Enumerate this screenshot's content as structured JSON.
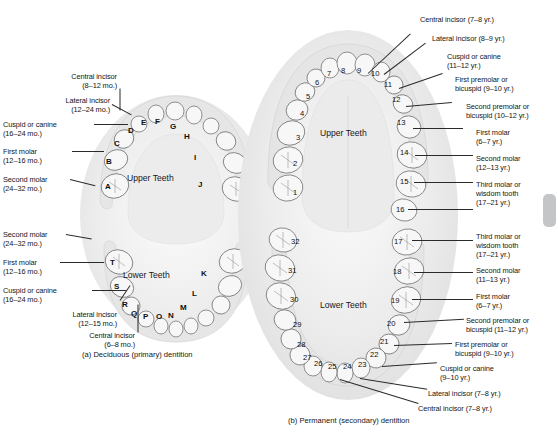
{
  "figure": {
    "panel_a": {
      "caption": "(a) Deciduous (primary) dentition",
      "upper_arch_name": "Upper Teeth",
      "lower_arch_name": "Lower Teeth",
      "upper_labels": [
        {
          "name": "Central incisor",
          "age": "(8–12 mo.)"
        },
        {
          "name": "Lateral incisor",
          "age": "(12–24 mo.)"
        },
        {
          "name": "Cuspid or canine",
          "age": "(16–24 mo.)"
        },
        {
          "name": "First molar",
          "age": "(12–16 mo.)"
        },
        {
          "name": "Second molar",
          "age": "(24–32 mo.)"
        }
      ],
      "lower_labels": [
        {
          "name": "Second molar",
          "age": "(24–32 mo.)"
        },
        {
          "name": "First molar",
          "age": "(12–16 mo.)"
        },
        {
          "name": "Cuspid or canine",
          "age": "(16–24 mo.)"
        },
        {
          "name": "Lateral incisor",
          "age": "(12–15 mo.)"
        },
        {
          "name": "Central incisor",
          "age": "(6–8 mo.)"
        }
      ],
      "upper_tooth_codes": [
        "A",
        "B",
        "C",
        "D",
        "E",
        "F",
        "G",
        "H",
        "I",
        "J"
      ],
      "lower_tooth_codes": [
        "K",
        "L",
        "M",
        "N",
        "O",
        "P",
        "Q",
        "R",
        "S",
        "T"
      ]
    },
    "panel_b": {
      "caption": "(b) Permanent (secondary) dentition",
      "upper_arch_name": "Upper Teeth",
      "lower_arch_name": "Lower Teeth",
      "upper_labels": [
        {
          "name": "Central incisor (7–8 yr.)"
        },
        {
          "name": "Lateral incisor (8–9 yr.)"
        },
        {
          "name": "Cuspid or canine",
          "age": "(11–12 yr.)"
        },
        {
          "name": "First premolar or",
          "age": "bicuspid (9–10 yr.)"
        },
        {
          "name": "Second premolar or",
          "age": "bicuspid (10–12 yr.)"
        },
        {
          "name": "First molar",
          "age": "(6–7 yr.)"
        },
        {
          "name": "Second molar",
          "age": "(12–13 yr.)"
        },
        {
          "name": "Third molar or",
          "age": "wisdom tooth",
          "age2": "(17–21 yr.)"
        }
      ],
      "lower_labels": [
        {
          "name": "Third molar or",
          "age": "wisdom tooth",
          "age2": "(17–21 yr.)"
        },
        {
          "name": "Second molar",
          "age": "(11–13 yr.)"
        },
        {
          "name": "First molar",
          "age": "(6–7 yr.)"
        },
        {
          "name": "Second premolar or",
          "age": "bicuspid (11–12 yr.)"
        },
        {
          "name": "First premolar or",
          "age": "bicuspid (9–10 yr.)"
        },
        {
          "name": "Cuspid or canine",
          "age": "(9–10 yr.)"
        },
        {
          "name": "Lateral incisor (7–8 yr.)"
        },
        {
          "name": "Central incisor (7–8 yr.)"
        }
      ],
      "upper_tooth_numbers": [
        "1",
        "2",
        "3",
        "4",
        "5",
        "6",
        "7",
        "8",
        "9",
        "10",
        "11",
        "12",
        "13",
        "14",
        "15",
        "16"
      ],
      "lower_tooth_numbers": [
        "17",
        "18",
        "19",
        "20",
        "21",
        "22",
        "23",
        "24",
        "25",
        "26",
        "27",
        "28",
        "29",
        "30",
        "31",
        "32"
      ]
    }
  },
  "colors": {
    "background": "#ffffff",
    "ink": "#161616",
    "tooth_fill": "#f7f7f7",
    "tooth_outline": "#6f6f6f",
    "gum": "#e9e9e9",
    "scrollbar": "#c3c5c7"
  }
}
